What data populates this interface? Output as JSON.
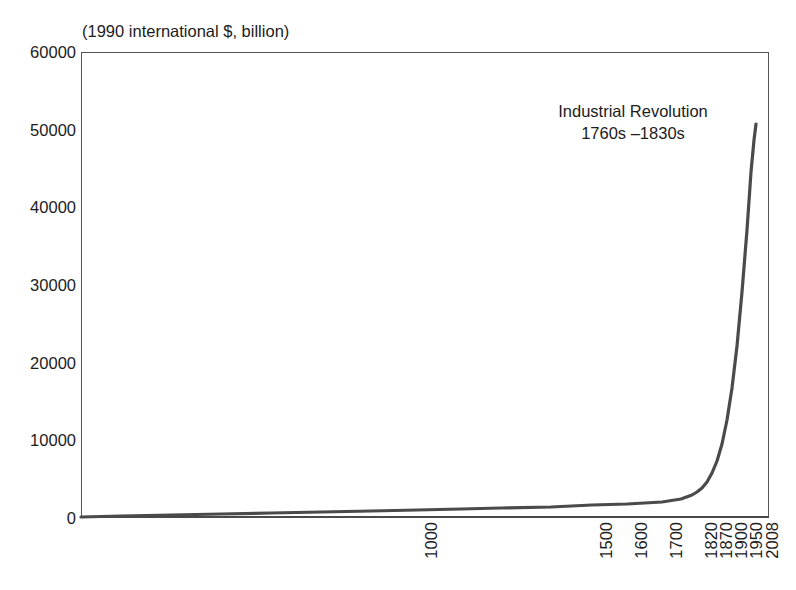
{
  "chart_data": {
    "type": "line",
    "title": "",
    "subtitle": "",
    "unit_caption": "(1990 international $, billion)",
    "xlabel": "",
    "ylabel": "",
    "ylim": [
      0,
      60000
    ],
    "yticks": [
      0,
      10000,
      20000,
      30000,
      40000,
      50000,
      60000
    ],
    "ytick_labels": [
      "0",
      "10000",
      "20000",
      "30000",
      "40000",
      "50000",
      "60000"
    ],
    "xtick_labels": [
      "1000",
      "1500",
      "1600",
      "1700",
      "1820",
      "1870",
      "1900",
      "1950",
      "2008"
    ],
    "xtick_positions_px": [
      417,
      592,
      627,
      662,
      697,
      712,
      727,
      742,
      758
    ],
    "grid": false,
    "legend": null,
    "line_color": "#4a4a4a",
    "band_color": "#f1f1f1",
    "annotations": [
      {
        "name": "industrial-revolution",
        "line1": "Industrial Revolution",
        "line2": "1760s –1830s",
        "band_start_year": 1760,
        "band_end_year": 1830
      }
    ],
    "series": [
      {
        "name": "World GDP",
        "x": [
          1000,
          1500,
          1600,
          1700,
          1820,
          1870,
          1900,
          1950,
          2008
        ],
        "values": [
          121,
          248,
          331,
          371,
          694,
          1111,
          1973,
          5336,
          51000
        ]
      }
    ],
    "curve_points_px": [
      [
        0,
        465
      ],
      [
        40,
        464
      ],
      [
        90,
        463
      ],
      [
        140,
        462
      ],
      [
        190,
        461
      ],
      [
        240,
        460
      ],
      [
        290,
        459
      ],
      [
        336,
        458
      ],
      [
        380,
        457
      ],
      [
        420,
        456
      ],
      [
        470,
        455
      ],
      [
        511,
        453
      ],
      [
        546,
        452
      ],
      [
        581,
        450
      ],
      [
        600,
        447
      ],
      [
        611,
        443
      ],
      [
        616,
        440
      ],
      [
        621,
        436
      ],
      [
        626,
        430
      ],
      [
        631,
        421
      ],
      [
        636,
        409
      ],
      [
        641,
        392
      ],
      [
        646,
        368
      ],
      [
        651,
        336
      ],
      [
        656,
        294
      ],
      [
        661,
        240
      ],
      [
        666,
        178
      ],
      [
        670,
        120
      ],
      [
        673,
        88
      ],
      [
        675,
        72
      ]
    ]
  }
}
